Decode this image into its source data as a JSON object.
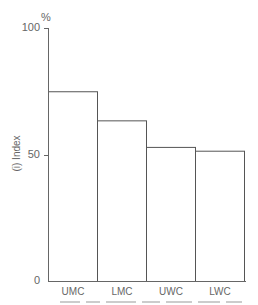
{
  "chart_data": {
    "type": "bar",
    "title": "",
    "xlabel": "",
    "ylabel": "(i) Index",
    "y_unit": "%",
    "ylim": [
      0,
      100
    ],
    "yticks": [
      0,
      50,
      100
    ],
    "grid": false,
    "legend": null,
    "bar_style": "outlined, no gaps",
    "categories": [
      "UMC",
      "LMC",
      "UWC",
      "LWC"
    ],
    "values": [
      75,
      63.5,
      53,
      51.5
    ]
  },
  "colors": {
    "axis": "#666666",
    "bar_outline": "#555555",
    "text": "#666666"
  }
}
